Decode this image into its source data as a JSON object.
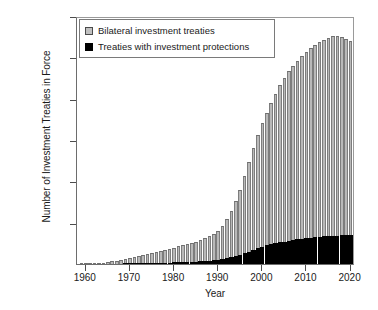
{
  "chart_data": {
    "type": "bar",
    "stacked": true,
    "title": "",
    "xlabel": "Year",
    "ylabel": "Number of Investment Treaties in Force",
    "xlim": [
      1958,
      2021
    ],
    "ylim": [
      0,
      3000
    ],
    "ytick_labels": [
      "3,000",
      "2,500",
      "2,000",
      "1,500",
      "1,000",
      "500"
    ],
    "ytick_values": [
      3000,
      2500,
      2000,
      1500,
      1000,
      500
    ],
    "xtick_labels": [
      "1960",
      "1970",
      "1980",
      "1990",
      "2000",
      "2010",
      "2020"
    ],
    "xtick_values": [
      1960,
      1970,
      1980,
      1990,
      2000,
      2010,
      2020
    ],
    "grid": false,
    "legend_position": "top-left",
    "legend": [
      {
        "label": "Bilateral investment treaties",
        "swatch": "gray"
      },
      {
        "label": "Treaties with investment protections",
        "swatch": "black"
      }
    ],
    "colors": {
      "bilateral": "#b9b9b9",
      "protections": "#000000",
      "axis": "#4d4d4d"
    },
    "x": [
      1959,
      1960,
      1961,
      1962,
      1963,
      1964,
      1965,
      1966,
      1967,
      1968,
      1969,
      1970,
      1971,
      1972,
      1973,
      1974,
      1975,
      1976,
      1977,
      1978,
      1979,
      1980,
      1981,
      1982,
      1983,
      1984,
      1985,
      1986,
      1987,
      1988,
      1989,
      1990,
      1991,
      1992,
      1993,
      1994,
      1995,
      1996,
      1997,
      1998,
      1999,
      2000,
      2001,
      2002,
      2003,
      2004,
      2005,
      2006,
      2007,
      2008,
      2009,
      2010,
      2011,
      2012,
      2013,
      2014,
      2015,
      2016,
      2017,
      2018,
      2019,
      2020
    ],
    "series": [
      {
        "name": "Bilateral investment treaties",
        "values": [
          2,
          3,
          5,
          8,
          12,
          18,
          25,
          33,
          42,
          52,
          63,
          75,
          88,
          100,
          112,
          124,
          136,
          148,
          160,
          172,
          185,
          198,
          212,
          226,
          240,
          256,
          272,
          290,
          310,
          335,
          365,
          405,
          460,
          540,
          640,
          760,
          900,
          1060,
          1230,
          1400,
          1560,
          1700,
          1830,
          1950,
          2060,
          2160,
          2250,
          2330,
          2400,
          2460,
          2520,
          2570,
          2615,
          2655,
          2690,
          2715,
          2740,
          2755,
          2760,
          2745,
          2720,
          2700
        ]
      },
      {
        "name": "Treaties with investment protections",
        "values": [
          0,
          0,
          0,
          1,
          1,
          2,
          3,
          4,
          5,
          6,
          7,
          8,
          9,
          10,
          11,
          12,
          13,
          14,
          15,
          16,
          18,
          20,
          22,
          24,
          26,
          28,
          30,
          33,
          36,
          40,
          44,
          50,
          58,
          68,
          80,
          95,
          112,
          130,
          150,
          170,
          190,
          208,
          224,
          238,
          250,
          262,
          272,
          282,
          292,
          300,
          308,
          314,
          320,
          325,
          330,
          334,
          338,
          341,
          344,
          347,
          349,
          352
        ]
      }
    ]
  }
}
